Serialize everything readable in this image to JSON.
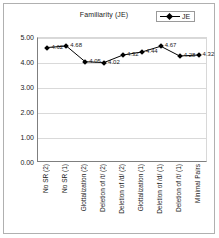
{
  "chart": {
    "title": "Familiarity (JE)",
    "legend_label": "JE",
    "legend_icon": "diamond-line-marker"
  },
  "chart_data": {
    "type": "line",
    "title": "Familiarity (JE)",
    "xlabel": "",
    "ylabel": "",
    "ylim": [
      0.0,
      5.0
    ],
    "ytick_labels": [
      "5.00",
      "4.00",
      "3.00",
      "2.00",
      "1.00",
      "0.00"
    ],
    "yticks": [
      5.0,
      4.0,
      3.0,
      2.0,
      1.0,
      0.0
    ],
    "grid": true,
    "legend_position": "top-right",
    "categories": [
      "No SR (2)",
      "No SR (1)",
      "Glottalization (2)",
      "Deletion of /t/ (2)",
      "Deletion of /d/ (2)",
      "Glottalization (1)",
      "Deletion of /d/ (1)",
      "Deletion of /t/ (1)",
      "Minimal Pairs"
    ],
    "series": [
      {
        "name": "JE",
        "values": [
          4.62,
          4.68,
          4.05,
          4.02,
          4.32,
          4.44,
          4.67,
          4.28,
          4.32
        ],
        "point_labels": [
          "4.62",
          "4.68",
          "4.05",
          "4.02",
          "4.32",
          "4.44",
          "4.67",
          "4.28",
          "4.32"
        ],
        "color": "#000000",
        "marker": "diamond"
      }
    ]
  }
}
